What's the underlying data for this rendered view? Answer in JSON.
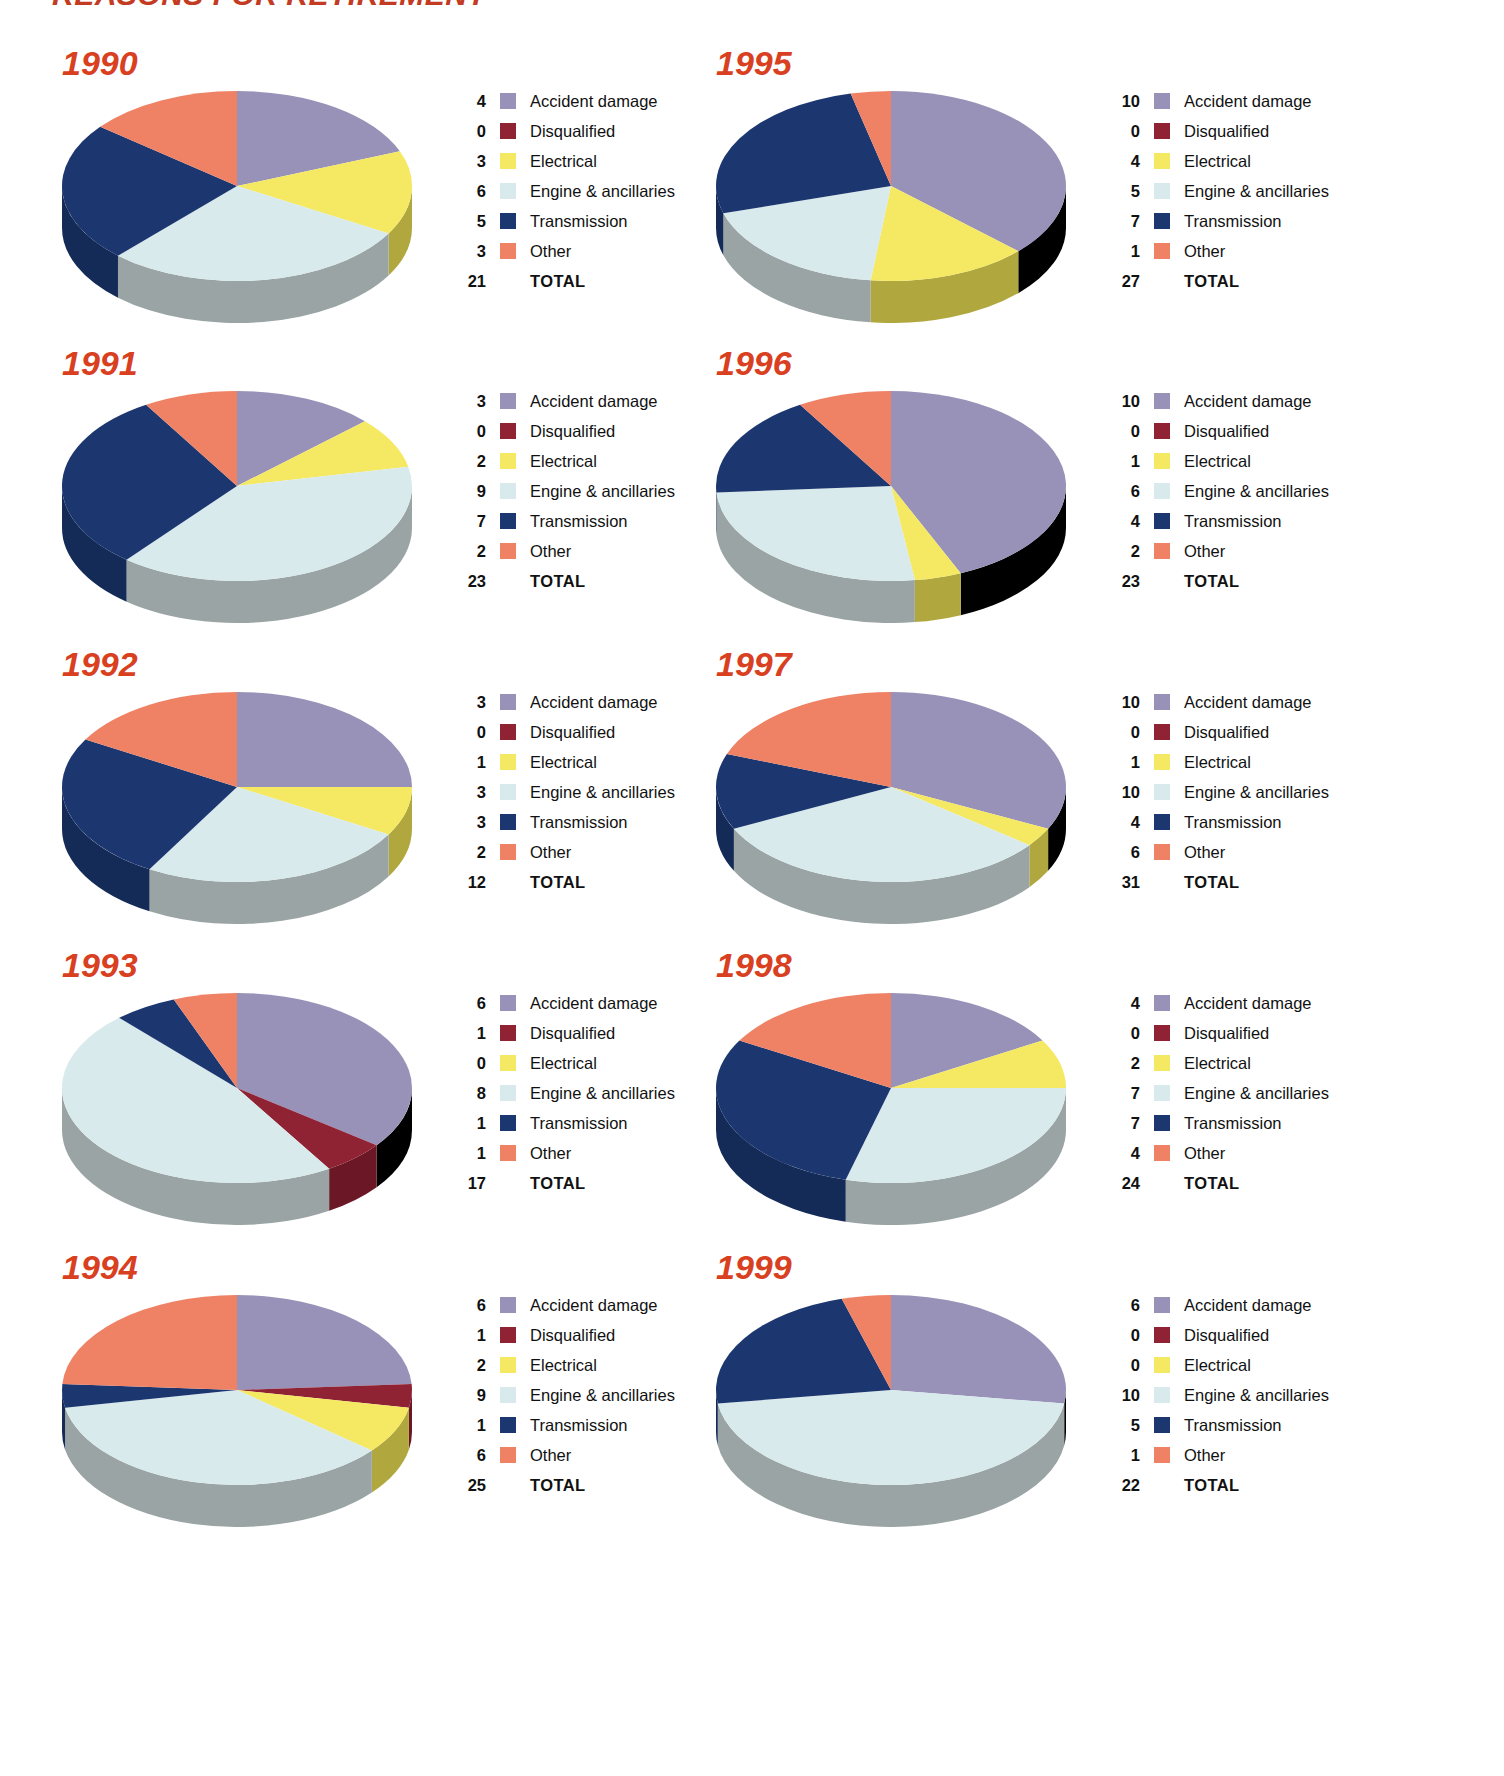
{
  "page": {
    "title": "REASONS FOR RETIREMENT",
    "title_color": "#c23b22",
    "year_color": "#d8401f",
    "background": "#ffffff"
  },
  "legend_labels": {
    "accident_damage": "Accident damage",
    "disqualified": "Disqualified",
    "electrical": "Electrical",
    "engine": "Engine & ancillaries",
    "transmission": "Transmission",
    "other": "Other",
    "total": "TOTAL"
  },
  "colors": {
    "accident_damage": "#9891b8",
    "disqualified": "#8f2233",
    "electrical": "#f5e862",
    "engine": "#d8eaec",
    "transmission": "#1c3770",
    "other": "#ef8164",
    "side_gray": "#9aa4a4",
    "side_accident": "#6e6788",
    "side_disqualified": "#6b1726",
    "side_electrical": "#b0a83f",
    "side_engine": "#9aa4a4",
    "side_transmission": "#142a57",
    "side_other": "#c26248"
  },
  "chart_data": {
    "type": "pie",
    "title": "REASONS FOR RETIREMENT",
    "categories": [
      "Accident damage",
      "Disqualified",
      "Electrical",
      "Engine & ancillaries",
      "Transmission",
      "Other"
    ],
    "category_colors": [
      "#9891b8",
      "#8f2233",
      "#f5e862",
      "#d8eaec",
      "#1c3770",
      "#ef8164"
    ],
    "legend_position": "right",
    "charts": [
      {
        "year": "1990",
        "values": [
          4,
          3,
          6,
          5,
          3,
          0
        ],
        "slices": [
          {
            "category": "Accident damage",
            "value": 4
          },
          {
            "category": "Disqualified",
            "value": 0
          },
          {
            "category": "Electrical",
            "value": 3
          },
          {
            "category": "Engine & ancillaries",
            "value": 6
          },
          {
            "category": "Transmission",
            "value": 5
          },
          {
            "category": "Other",
            "value": 3
          }
        ],
        "total": 21
      },
      {
        "year": "1991",
        "slices": [
          {
            "category": "Accident damage",
            "value": 3
          },
          {
            "category": "Disqualified",
            "value": 0
          },
          {
            "category": "Electrical",
            "value": 2
          },
          {
            "category": "Engine & ancillaries",
            "value": 9
          },
          {
            "category": "Transmission",
            "value": 7
          },
          {
            "category": "Other",
            "value": 2
          }
        ],
        "total": 23
      },
      {
        "year": "1992",
        "slices": [
          {
            "category": "Accident damage",
            "value": 3
          },
          {
            "category": "Disqualified",
            "value": 0
          },
          {
            "category": "Electrical",
            "value": 1
          },
          {
            "category": "Engine & ancillaries",
            "value": 3
          },
          {
            "category": "Transmission",
            "value": 3
          },
          {
            "category": "Other",
            "value": 2
          }
        ],
        "total": 12
      },
      {
        "year": "1993",
        "slices": [
          {
            "category": "Accident damage",
            "value": 6
          },
          {
            "category": "Disqualified",
            "value": 1
          },
          {
            "category": "Electrical",
            "value": 0
          },
          {
            "category": "Engine & ancillaries",
            "value": 8
          },
          {
            "category": "Transmission",
            "value": 1
          },
          {
            "category": "Other",
            "value": 1
          }
        ],
        "total": 17
      },
      {
        "year": "1994",
        "slices": [
          {
            "category": "Accident damage",
            "value": 6
          },
          {
            "category": "Disqualified",
            "value": 1
          },
          {
            "category": "Electrical",
            "value": 2
          },
          {
            "category": "Engine & ancillaries",
            "value": 9
          },
          {
            "category": "Transmission",
            "value": 1
          },
          {
            "category": "Other",
            "value": 6
          }
        ],
        "total": 25
      },
      {
        "year": "1995",
        "slices": [
          {
            "category": "Accident damage",
            "value": 10
          },
          {
            "category": "Disqualified",
            "value": 0
          },
          {
            "category": "Electrical",
            "value": 4
          },
          {
            "category": "Engine & ancillaries",
            "value": 5
          },
          {
            "category": "Transmission",
            "value": 7
          },
          {
            "category": "Other",
            "value": 1
          }
        ],
        "total": 27
      },
      {
        "year": "1996",
        "slices": [
          {
            "category": "Accident damage",
            "value": 10
          },
          {
            "category": "Disqualified",
            "value": 0
          },
          {
            "category": "Electrical",
            "value": 1
          },
          {
            "category": "Engine & ancillaries",
            "value": 6
          },
          {
            "category": "Transmission",
            "value": 4
          },
          {
            "category": "Other",
            "value": 2
          }
        ],
        "total": 23
      },
      {
        "year": "1997",
        "slices": [
          {
            "category": "Accident damage",
            "value": 10
          },
          {
            "category": "Disqualified",
            "value": 0
          },
          {
            "category": "Electrical",
            "value": 1
          },
          {
            "category": "Engine & ancillaries",
            "value": 10
          },
          {
            "category": "Transmission",
            "value": 4
          },
          {
            "category": "Other",
            "value": 6
          }
        ],
        "total": 31
      },
      {
        "year": "1998",
        "slices": [
          {
            "category": "Accident damage",
            "value": 4
          },
          {
            "category": "Disqualified",
            "value": 0
          },
          {
            "category": "Electrical",
            "value": 2
          },
          {
            "category": "Engine & ancillaries",
            "value": 7
          },
          {
            "category": "Transmission",
            "value": 7
          },
          {
            "category": "Other",
            "value": 4
          }
        ],
        "total": 24
      },
      {
        "year": "1999",
        "slices": [
          {
            "category": "Accident damage",
            "value": 6
          },
          {
            "category": "Disqualified",
            "value": 0
          },
          {
            "category": "Electrical",
            "value": 0
          },
          {
            "category": "Engine & ancillaries",
            "value": 10
          },
          {
            "category": "Transmission",
            "value": 5
          },
          {
            "category": "Other",
            "value": 1
          }
        ],
        "total": 22
      }
    ]
  }
}
